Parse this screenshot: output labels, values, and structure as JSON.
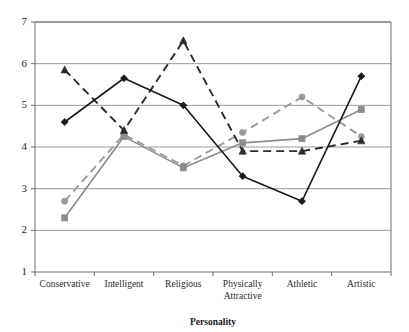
{
  "chart_data": {
    "type": "line",
    "title": "",
    "xlabel": "Personality",
    "ylabel": "",
    "ylim": [
      1,
      7
    ],
    "yticks": [
      1,
      2,
      3,
      4,
      5,
      6,
      7
    ],
    "grid": true,
    "legend": "none",
    "categories": [
      "Conservative",
      "Intelligent",
      "Religious",
      "Physically Attractive",
      "Athletic",
      "Artistic"
    ],
    "category_labels_wrapped": [
      [
        "Conservative"
      ],
      [
        "Intelligent"
      ],
      [
        "Religious"
      ],
      [
        "Physically",
        "Attractive"
      ],
      [
        "Athletic"
      ],
      [
        "Artistic"
      ]
    ],
    "series": [
      {
        "name": "Series 1",
        "marker": "diamond",
        "line_style": "solid",
        "color": "#1a1a1a",
        "values": [
          4.6,
          5.65,
          5.0,
          3.3,
          2.7,
          5.7
        ]
      },
      {
        "name": "Series 2",
        "marker": "triangle",
        "line_style": "dashed",
        "color": "#2b2b2b",
        "values": [
          5.85,
          4.4,
          6.55,
          3.9,
          3.9,
          4.15
        ]
      },
      {
        "name": "Series 3",
        "marker": "square",
        "line_style": "solid",
        "color": "#8c8c8c",
        "values": [
          2.3,
          4.25,
          3.5,
          4.1,
          4.2,
          4.9
        ]
      },
      {
        "name": "Series 4",
        "marker": "circle",
        "line_style": "dashed",
        "color": "#9a9a9a",
        "values": [
          2.7,
          4.3,
          3.55,
          4.35,
          5.2,
          4.25
        ]
      }
    ]
  }
}
